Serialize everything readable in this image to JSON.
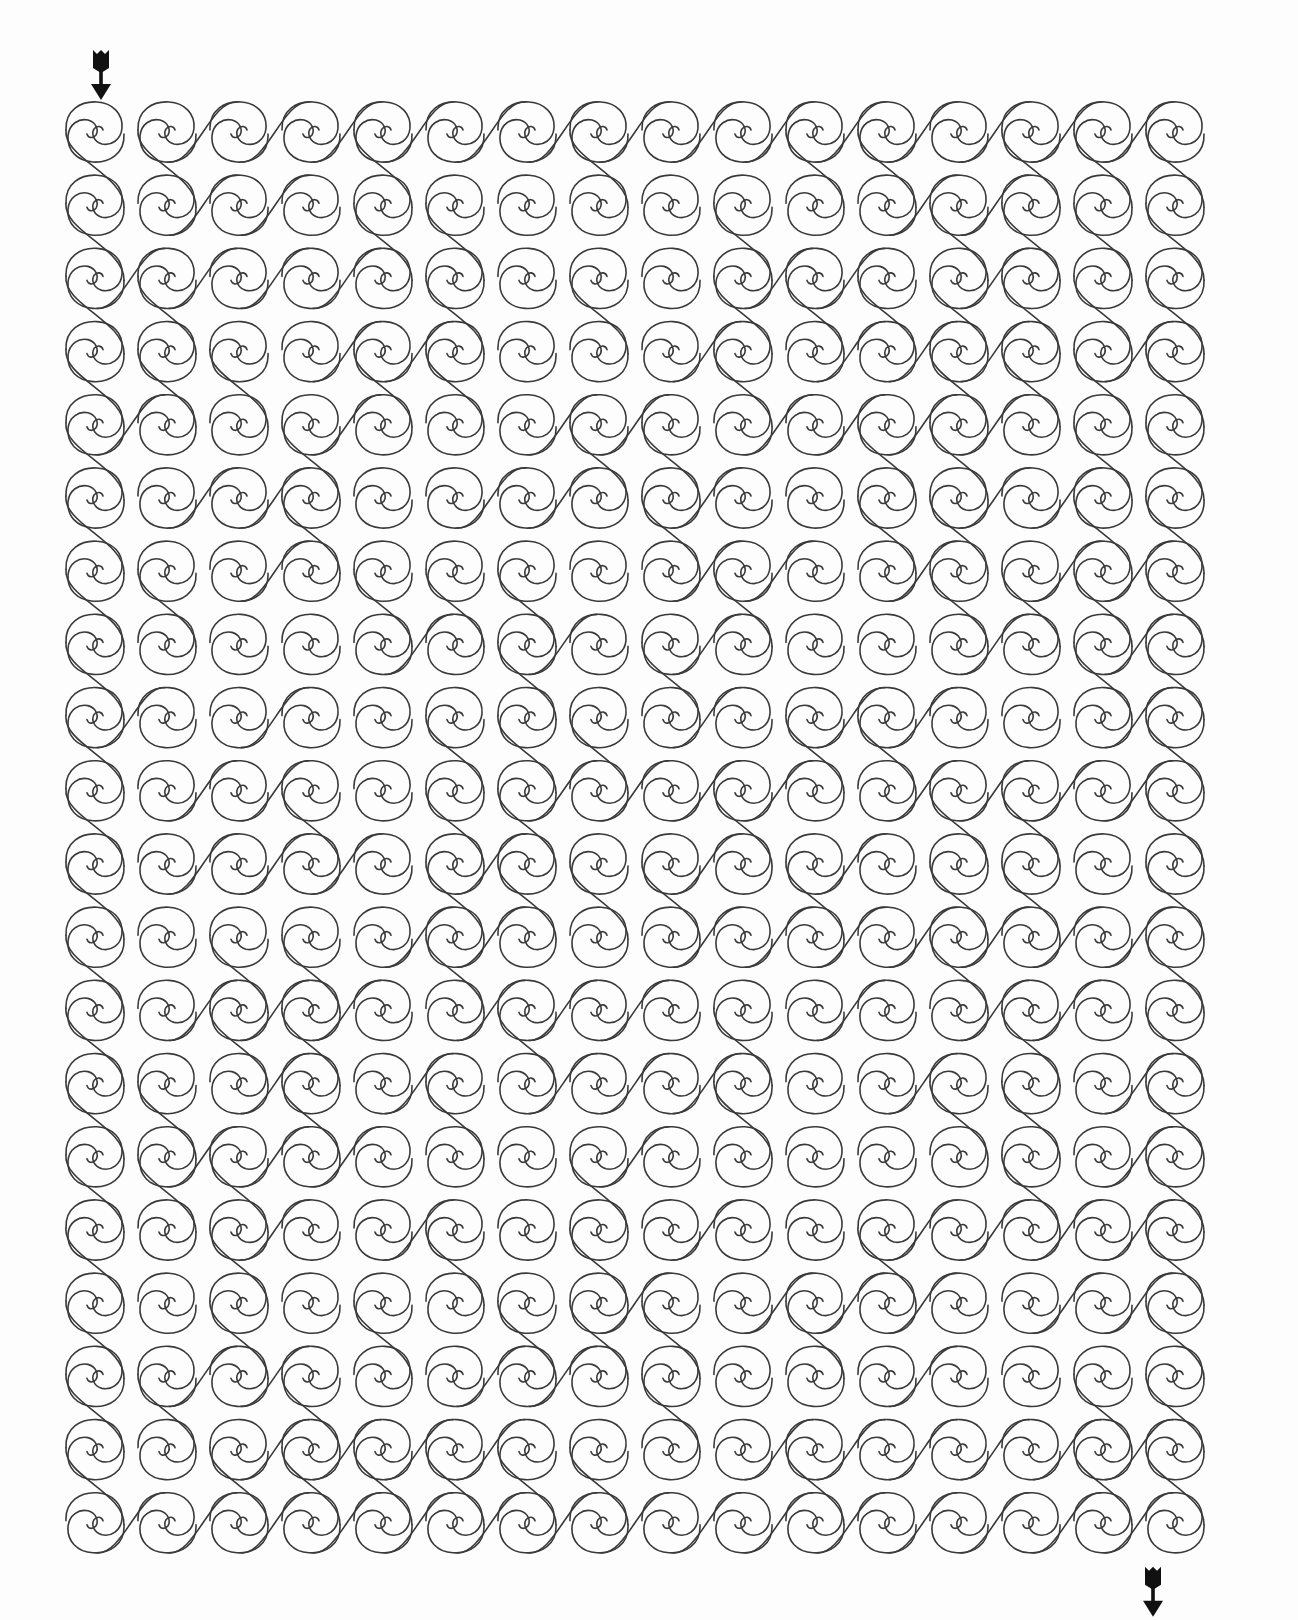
{
  "puzzle": {
    "type": "maze",
    "style": "spiral-wave",
    "title": "Spiral Maze",
    "columns": 16,
    "rows": 20,
    "start": {
      "label": "Start",
      "column": 0,
      "row": 0,
      "direction": "down",
      "icon": "arrow-down-icon"
    },
    "end": {
      "label": "Finish",
      "column": 15,
      "row": 19,
      "direction": "down",
      "icon": "arrow-down-icon"
    },
    "colors": {
      "line": "#3a3a3a",
      "background": "#fdfdfd",
      "arrow": "#111111"
    },
    "links": {
      "vertical_full_columns": [
        0,
        15
      ],
      "horizontal_rows_full": [
        0,
        19
      ],
      "horizontal_from_col0_rows": [
        2,
        4,
        8
      ],
      "pattern_seed": 7
    }
  }
}
